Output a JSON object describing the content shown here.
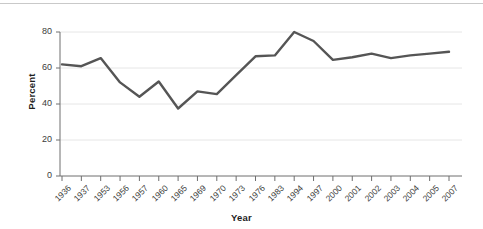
{
  "figure": {
    "name": "percent-by-year-line-chart",
    "background_color": "#ffffff",
    "top_rule_color": "#c9c9c9"
  },
  "chart_data": {
    "type": "line",
    "title": "",
    "subtitle": "",
    "xlabel": "Year",
    "ylabel": "Percent",
    "categories": [
      "1936",
      "1937",
      "1953",
      "1956",
      "1957",
      "1960",
      "1965",
      "1969",
      "1970",
      "1973",
      "1976",
      "1983",
      "1994",
      "1997",
      "2000",
      "2001",
      "2002",
      "2003",
      "2004",
      "2005",
      "2007"
    ],
    "values": [
      62,
      61,
      65.5,
      52,
      44,
      52.5,
      37.5,
      47,
      45.5,
      56,
      66.5,
      67,
      80,
      75,
      64.5,
      66,
      68,
      65.5,
      67,
      68,
      69
    ],
    "series": [
      {
        "name": "Percent",
        "color": "#555555",
        "line_width": 2.4,
        "values": [
          62,
          61,
          65.5,
          52,
          44,
          52.5,
          37.5,
          47,
          45.5,
          56,
          66.5,
          67,
          80,
          75,
          64.5,
          66,
          68,
          65.5,
          67,
          68,
          69
        ]
      }
    ],
    "ylim": [
      0,
      80
    ],
    "yticks": [
      0,
      20,
      40,
      60,
      80
    ],
    "ytick_labels": [
      "0",
      "20",
      "40",
      "60",
      "80"
    ],
    "xtick_rotation": -45,
    "grid": true,
    "grid_axis": "y",
    "grid_color": "#e6e6e6",
    "axis_color": "#6e6e6e",
    "legend": false,
    "legend_position": "none"
  }
}
